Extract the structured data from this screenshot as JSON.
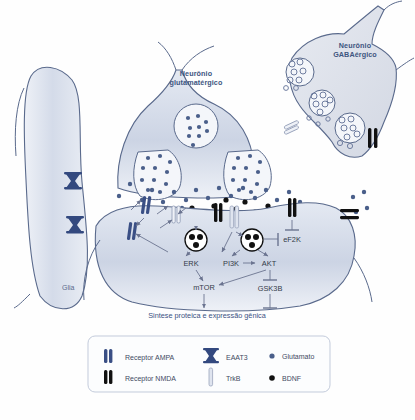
{
  "figure": {
    "type": "biological-pathway-diagram",
    "language": "pt-BR",
    "background": "#ffffff"
  },
  "colors": {
    "cell_fill_light": "#dfe4ef",
    "cell_fill_mid": "#c9d2e2",
    "outline": "#5a6a8c",
    "glutamate_dot": "#4a5f8a",
    "bdnf_dot": "#111111",
    "ampa_receptor": "#3a4f85",
    "nmda_receptor": "#111111",
    "eaat3": "#33497f",
    "label_blue": "#3d5580",
    "arrow": "#6b7490",
    "legend_border": "#c3cbdb"
  },
  "labels": {
    "glutamatergic_neuron": "Neurônio\nglutamatérgico",
    "glutamatergic_line1": "Neurônio",
    "glutamatergic_line2": "glutamatérgico",
    "gabaergic_line1": "Neurônio",
    "gabaergic_line2": "GABAérgico",
    "glia": "Glia"
  },
  "pathway": {
    "nodes": [
      {
        "id": "ERK",
        "label": "ERK",
        "x": 191,
        "y": 263
      },
      {
        "id": "PI3K",
        "label": "PI3K",
        "x": 231,
        "y": 263
      },
      {
        "id": "AKT",
        "label": "AKT",
        "x": 267,
        "y": 263
      },
      {
        "id": "mTOR",
        "label": "mTOR",
        "x": 204,
        "y": 287
      },
      {
        "id": "GSK3B",
        "label": "GSK3B",
        "x": 268,
        "y": 288
      },
      {
        "id": "eF2K",
        "label": "eF2K",
        "x": 290,
        "y": 239
      }
    ],
    "edges": [
      {
        "from": "PI3K",
        "to": "AKT",
        "kind": "activation"
      },
      {
        "from": "ERK",
        "to": "mTOR",
        "kind": "activation"
      },
      {
        "from": "AKT",
        "to": "mTOR",
        "kind": "activation"
      },
      {
        "from": "AKT",
        "to": "GSK3B",
        "kind": "inhibition"
      },
      {
        "from": "BDNF-vesicle",
        "to": "eF2K",
        "kind": "inhibition"
      },
      {
        "from": "NMDA-right",
        "to": "eF2K",
        "kind": "inhibition"
      },
      {
        "from": "mTOR",
        "to": "output",
        "kind": "activation"
      },
      {
        "from": "GSK3B",
        "to": "output",
        "kind": "inhibition"
      }
    ],
    "output_label": "Sintese proteica e expressão gênica"
  },
  "legend": {
    "items": [
      {
        "icon": "ampa-receptor-icon",
        "label": "Receptor AMPA"
      },
      {
        "icon": "eaat3-icon",
        "label": "EAAT3"
      },
      {
        "icon": "glutamate-dot-icon",
        "label": "Glutamato"
      },
      {
        "icon": "nmda-receptor-icon",
        "label": "Receptor NMDA"
      },
      {
        "icon": "trkb-icon",
        "label": "TrkB"
      },
      {
        "icon": "bdnf-dot-icon",
        "label": "BDNF"
      }
    ]
  }
}
